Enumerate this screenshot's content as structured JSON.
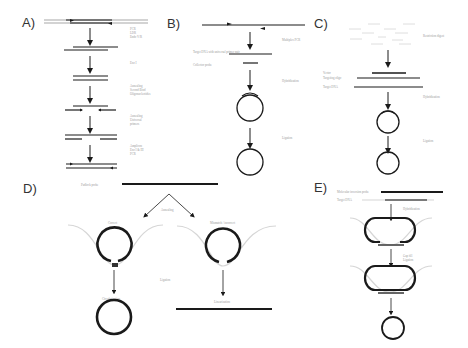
{
  "figure": {
    "panels": [
      {
        "id": "A",
        "label": "A)",
        "steps": [
          {
            "label_lines": [
              "PCR",
              "LDR",
              "Endo V/R"
            ]
          },
          {
            "label_lines": [
              "Exo I"
            ]
          },
          {
            "label_lines": [
              "Annealing",
              "Second Bind",
              "Oligonucleotides"
            ]
          },
          {
            "label_lines": [
              "Annealing",
              "Universal",
              "primers"
            ]
          },
          {
            "label_lines": [
              "Amplicon",
              "Exo I & III",
              "PCR"
            ]
          }
        ]
      },
      {
        "id": "B",
        "label": "B)",
        "labels": {
          "step1": "Multiplex PCR",
          "target": "Target DNA with universal primer pair",
          "probe": "Collector probe",
          "step2": "Hybridization",
          "step3": "Ligation"
        }
      },
      {
        "id": "C",
        "label": "C)",
        "labels": {
          "step1": "Restriction digest",
          "vector": "Vector",
          "targeting": "Targeting oligo",
          "target": "Target DNA",
          "step2": "Hybridization",
          "step3": "Ligation"
        }
      },
      {
        "id": "D",
        "label": "D)",
        "labels": {
          "probe": "Padlock probe",
          "step1": "Annealing",
          "left_case": "Correct",
          "right_case": "Mismatch / incorrect",
          "step2": "Ligation",
          "left_result": "Circularization",
          "right_result": "Linearization"
        }
      },
      {
        "id": "E",
        "label": "E)",
        "labels": {
          "probe": "Molecular inversion probe",
          "target": "Target DNA",
          "step1": "Hybridization",
          "step2_lines": [
            "Gap fill",
            "Ligation"
          ]
        }
      }
    ]
  }
}
